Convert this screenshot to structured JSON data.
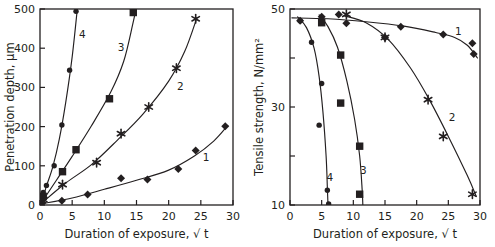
{
  "figure": {
    "panel_count": 2,
    "colors": {
      "ink": "#231f20",
      "background": "#ffffff"
    }
  },
  "left_panel": {
    "y_axis_title": "Penetration depth, µm",
    "x_axis_title": "Duration of exposure, √ t",
    "y_ticks": [
      "0",
      "100",
      "200",
      "300",
      "400",
      "500"
    ],
    "x_ticks": [
      "0",
      "5",
      "10",
      "15",
      "20",
      "25",
      "30"
    ],
    "curve_labels": [
      "1",
      "2",
      "3",
      "4"
    ]
  },
  "right_panel": {
    "y_axis_title": "Tensile strength, N/mm²",
    "x_axis_title": "Duration of exposure, √ t",
    "y_ticks": [
      "10",
      "30",
      "50"
    ],
    "y_minor_ticks": [
      "20",
      "40"
    ],
    "x_ticks": [
      "0",
      "5",
      "10",
      "15",
      "20",
      "25",
      "30"
    ],
    "curve_labels": [
      "1",
      "2",
      "3",
      "4"
    ]
  },
  "chart_data": [
    {
      "type": "scatter",
      "panel": "left",
      "title": "Penetration depth vs duration of exposure",
      "xlabel": "Duration of exposure, √ t",
      "ylabel": "Penetration depth, µm",
      "xlim": [
        0,
        30
      ],
      "ylim": [
        0,
        500
      ],
      "xticks": [
        0,
        5,
        10,
        15,
        20,
        25,
        30
      ],
      "yticks": [
        0,
        100,
        200,
        300,
        400,
        500
      ],
      "grid": false,
      "legend": "inline curve labels",
      "series": [
        {
          "name": "1",
          "marker": "diamond",
          "label_x": 25.8,
          "label_y": 112,
          "points": [
            {
              "x": 0.4,
              "y": 6
            },
            {
              "x": 3.4,
              "y": 11
            },
            {
              "x": 7.4,
              "y": 27
            },
            {
              "x": 12.6,
              "y": 68
            },
            {
              "x": 16.7,
              "y": 65
            },
            {
              "x": 21.5,
              "y": 92
            },
            {
              "x": 24.2,
              "y": 139
            },
            {
              "x": 28.8,
              "y": 201
            }
          ],
          "curve": [
            {
              "x": 0.2,
              "y": 3
            },
            {
              "x": 5.0,
              "y": 18
            },
            {
              "x": 10.0,
              "y": 40
            },
            {
              "x": 15.0,
              "y": 63
            },
            {
              "x": 20.0,
              "y": 89
            },
            {
              "x": 24.0,
              "y": 125
            },
            {
              "x": 27.0,
              "y": 163
            },
            {
              "x": 29.2,
              "y": 203
            }
          ]
        },
        {
          "name": "2",
          "marker": "star",
          "label_x": 21.8,
          "label_y": 293,
          "points": [
            {
              "x": 0.5,
              "y": 14
            },
            {
              "x": 3.5,
              "y": 52
            },
            {
              "x": 8.8,
              "y": 108
            },
            {
              "x": 12.6,
              "y": 182
            },
            {
              "x": 16.9,
              "y": 250
            },
            {
              "x": 21.2,
              "y": 349
            },
            {
              "x": 24.2,
              "y": 475
            }
          ],
          "curve": [
            {
              "x": 0.2,
              "y": 4
            },
            {
              "x": 4.0,
              "y": 56
            },
            {
              "x": 8.0,
              "y": 103
            },
            {
              "x": 12.0,
              "y": 165
            },
            {
              "x": 16.0,
              "y": 232
            },
            {
              "x": 20.0,
              "y": 316
            },
            {
              "x": 22.5,
              "y": 392
            },
            {
              "x": 24.4,
              "y": 478
            }
          ]
        },
        {
          "name": "3",
          "marker": "square",
          "label_x": 12.6,
          "label_y": 392,
          "points": [
            {
              "x": 0.5,
              "y": 22
            },
            {
              "x": 3.5,
              "y": 85
            },
            {
              "x": 5.6,
              "y": 141
            },
            {
              "x": 10.8,
              "y": 271
            },
            {
              "x": 14.5,
              "y": 491
            }
          ],
          "curve": [
            {
              "x": 0.2,
              "y": 5
            },
            {
              "x": 2.5,
              "y": 62
            },
            {
              "x": 5.0,
              "y": 124
            },
            {
              "x": 8.0,
              "y": 202
            },
            {
              "x": 11.0,
              "y": 288
            },
            {
              "x": 13.0,
              "y": 366
            },
            {
              "x": 14.4,
              "y": 460
            },
            {
              "x": 14.9,
              "y": 500
            }
          ]
        },
        {
          "name": "4",
          "marker": "circle",
          "label_x": 6.6,
          "label_y": 425,
          "points": [
            {
              "x": 0.5,
              "y": 32
            },
            {
              "x": 1.0,
              "y": 50
            },
            {
              "x": 2.2,
              "y": 100
            },
            {
              "x": 3.4,
              "y": 204
            },
            {
              "x": 4.6,
              "y": 344
            },
            {
              "x": 5.6,
              "y": 494
            }
          ],
          "curve": [
            {
              "x": 0.3,
              "y": 8
            },
            {
              "x": 1.0,
              "y": 48
            },
            {
              "x": 2.0,
              "y": 98
            },
            {
              "x": 3.0,
              "y": 168
            },
            {
              "x": 4.0,
              "y": 262
            },
            {
              "x": 5.0,
              "y": 378
            },
            {
              "x": 5.8,
              "y": 500
            }
          ]
        }
      ]
    },
    {
      "type": "scatter",
      "panel": "right",
      "title": "Tensile strength vs duration of exposure",
      "xlabel": "Duration of exposure, √ t",
      "ylabel": "Tensile strength, N/mm²",
      "xlim": [
        0,
        30
      ],
      "ylim": [
        10,
        50
      ],
      "xticks": [
        0,
        5,
        10,
        15,
        20,
        25,
        30
      ],
      "yticks": [
        10,
        30,
        50
      ],
      "yticks_minor": [
        20,
        40
      ],
      "grid": false,
      "legend": "inline curve labels",
      "series": [
        {
          "name": "1",
          "marker": "diamond",
          "label_x": 26.6,
          "label_y": 44.7,
          "points": [
            {
              "x": 1.6,
              "y": 47.6
            },
            {
              "x": 5.0,
              "y": 48.4
            },
            {
              "x": 7.7,
              "y": 48.9
            },
            {
              "x": 8.9,
              "y": 47.1
            },
            {
              "x": 15.0,
              "y": 44.2
            },
            {
              "x": 17.5,
              "y": 46.4
            },
            {
              "x": 24.2,
              "y": 44.8
            },
            {
              "x": 28.8,
              "y": 43.0
            },
            {
              "x": 29.0,
              "y": 40.8
            }
          ],
          "curve": [
            {
              "x": 0.3,
              "y": 48.2
            },
            {
              "x": 6.0,
              "y": 48.0
            },
            {
              "x": 12.0,
              "y": 47.4
            },
            {
              "x": 18.0,
              "y": 46.5
            },
            {
              "x": 23.0,
              "y": 45.2
            },
            {
              "x": 26.0,
              "y": 44.2
            },
            {
              "x": 28.0,
              "y": 42.6
            },
            {
              "x": 29.6,
              "y": 40.0
            }
          ]
        },
        {
          "name": "2",
          "marker": "star",
          "label_x": 25.6,
          "label_y": 27.2,
          "points": [
            {
              "x": 8.9,
              "y": 48.9
            },
            {
              "x": 15.0,
              "y": 44.2
            },
            {
              "x": 21.8,
              "y": 31.5
            },
            {
              "x": 24.2,
              "y": 24.0
            },
            {
              "x": 28.8,
              "y": 12.2
            }
          ],
          "curve": [
            {
              "x": 8.6,
              "y": 48.6
            },
            {
              "x": 12.0,
              "y": 47.2
            },
            {
              "x": 15.5,
              "y": 43.8
            },
            {
              "x": 19.0,
              "y": 38.0
            },
            {
              "x": 22.0,
              "y": 31.5
            },
            {
              "x": 25.0,
              "y": 24.0
            },
            {
              "x": 28.0,
              "y": 16.0
            },
            {
              "x": 29.4,
              "y": 11.8
            }
          ]
        },
        {
          "name": "3",
          "marker": "square",
          "label_x": 11.6,
          "label_y": 16.3,
          "points": [
            {
              "x": 5.0,
              "y": 47.2
            },
            {
              "x": 8.0,
              "y": 40.6
            },
            {
              "x": 8.0,
              "y": 30.8
            },
            {
              "x": 11.0,
              "y": 22.0
            },
            {
              "x": 11.0,
              "y": 12.2
            }
          ],
          "curve": [
            {
              "x": 4.6,
              "y": 48.8
            },
            {
              "x": 6.0,
              "y": 46.4
            },
            {
              "x": 7.5,
              "y": 42.2
            },
            {
              "x": 9.0,
              "y": 35.2
            },
            {
              "x": 10.2,
              "y": 27.5
            },
            {
              "x": 11.0,
              "y": 20.0
            },
            {
              "x": 11.4,
              "y": 13.0
            },
            {
              "x": 11.5,
              "y": 10.0
            }
          ]
        },
        {
          "name": "4",
          "marker": "circle",
          "label_x": 6.3,
          "label_y": 15.0,
          "points": [
            {
              "x": 1.6,
              "y": 47.6
            },
            {
              "x": 3.4,
              "y": 43.2
            },
            {
              "x": 5.0,
              "y": 34.8
            },
            {
              "x": 4.6,
              "y": 26.3
            },
            {
              "x": 5.9,
              "y": 13.0
            },
            {
              "x": 6.1,
              "y": 10.2
            }
          ],
          "curve": [
            {
              "x": 1.2,
              "y": 48.4
            },
            {
              "x": 2.6,
              "y": 46.2
            },
            {
              "x": 3.8,
              "y": 42.0
            },
            {
              "x": 4.6,
              "y": 36.2
            },
            {
              "x": 5.2,
              "y": 29.0
            },
            {
              "x": 5.7,
              "y": 20.0
            },
            {
              "x": 5.9,
              "y": 13.5
            },
            {
              "x": 6.0,
              "y": 10.0
            }
          ]
        }
      ]
    }
  ]
}
